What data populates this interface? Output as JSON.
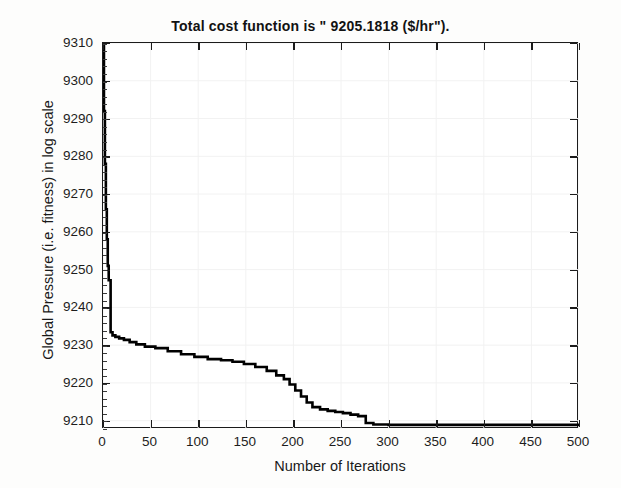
{
  "chart_data": {
    "type": "line",
    "title": "Total cost function is \" 9205.1818 ($/hr\").",
    "xlabel": "Number of Iterations",
    "ylabel": "Global Pressure (i.e. fitness) in log scale",
    "xlim": [
      0,
      500
    ],
    "ylim": [
      9207.8,
      9310
    ],
    "xticks": [
      0,
      50,
      100,
      150,
      200,
      250,
      300,
      350,
      400,
      450,
      500
    ],
    "yticks": [
      9210,
      9220,
      9230,
      9240,
      9250,
      9260,
      9270,
      9280,
      9290,
      9300,
      9310
    ],
    "grid": true,
    "legend": "none",
    "line_color": "#000000",
    "line_width": 2.6,
    "series": [
      {
        "name": "Global best fitness",
        "step": "post",
        "x": [
          0,
          1,
          2,
          3,
          4,
          5,
          6,
          8,
          10,
          13,
          17,
          22,
          28,
          35,
          44,
          55,
          68,
          82,
          96,
          110,
          124,
          136,
          148,
          160,
          172,
          182,
          190,
          196,
          202,
          208,
          214,
          220,
          228,
          236,
          244,
          252,
          260,
          268,
          276,
          284,
          300,
          340,
          400,
          460,
          500
        ],
        "y": [
          9310.0,
          9292.0,
          9278.0,
          9266.0,
          9258.0,
          9251.0,
          9247.2,
          9233.4,
          9232.6,
          9232.2,
          9231.8,
          9231.4,
          9230.8,
          9230.2,
          9229.6,
          9229.2,
          9228.4,
          9227.6,
          9226.9,
          9226.3,
          9226.0,
          9225.6,
          9225.0,
          9224.2,
          9223.2,
          9222.0,
          9221.0,
          9219.6,
          9218.0,
          9216.4,
          9214.8,
          9213.6,
          9213.0,
          9212.6,
          9212.3,
          9212.0,
          9211.6,
          9211.2,
          9209.4,
          9209.0,
          9208.9,
          9208.9,
          9208.9,
          9208.9,
          9208.9
        ]
      }
    ],
    "final_value": 9205.1818,
    "units": "$/hr"
  },
  "figure": {
    "background": "#fdfdfc",
    "plot_background": "#ffffff",
    "axis_color": "#1b1b1b"
  }
}
